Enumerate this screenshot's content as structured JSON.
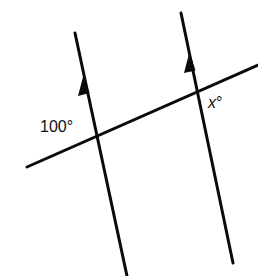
{
  "diagram": {
    "colors": {
      "line": "#0a0a0a",
      "background": "#ffffff",
      "text": "#111111"
    },
    "lines": {
      "left_parallel": {
        "x1": 75,
        "y1": 33,
        "x2": 127,
        "y2": 276,
        "arrow_at": [
          84,
          84
        ]
      },
      "right_parallel": {
        "x1": 181,
        "y1": 13,
        "x2": 233,
        "y2": 263,
        "arrow_at": [
          191,
          62
        ]
      },
      "transversal": {
        "x1": 27,
        "y1": 167,
        "x2": 258,
        "y2": 65
      }
    },
    "labels": {
      "angle_left": "100°",
      "angle_right_var": "x",
      "angle_right_deg": "°"
    }
  }
}
